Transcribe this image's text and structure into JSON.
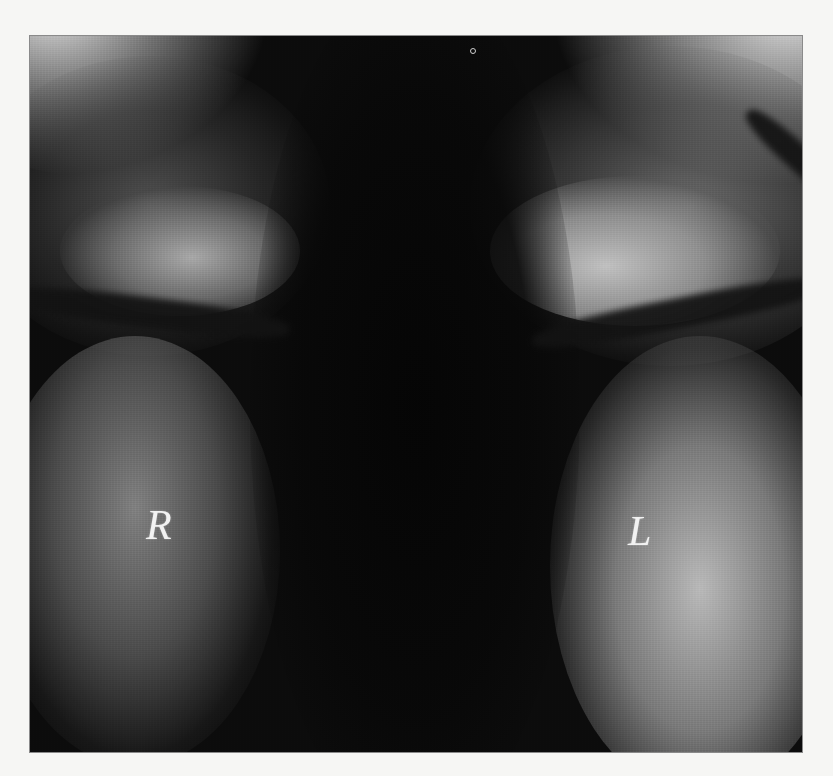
{
  "image": {
    "description": "Grayscale radiograph of upper chest showing lung fields separated by dark mediastinum with clavicle bands",
    "labels": {
      "right": "R",
      "left": "L"
    },
    "colors": {
      "background": "#f6f6f4",
      "film_dark": "#0c0c0c",
      "label_text": "#f2f2f2"
    }
  }
}
